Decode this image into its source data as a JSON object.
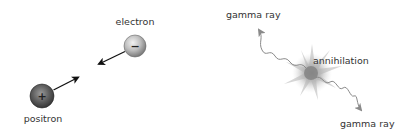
{
  "diagram": {
    "left_panel": {
      "electron": {
        "label": "electron",
        "sign": "−",
        "color": "#b0b0b0"
      },
      "positron": {
        "label": "positron",
        "sign": "+",
        "color": "#5a5a5a"
      }
    },
    "right_panel": {
      "event": {
        "label": "annihilation",
        "color": "#9a9a9a"
      },
      "gamma_rays": [
        {
          "label": "gamma ray",
          "direction": "up-left"
        },
        {
          "label": "gamma ray",
          "direction": "down-right"
        }
      ],
      "wave_color": "#8a8a8a"
    }
  }
}
